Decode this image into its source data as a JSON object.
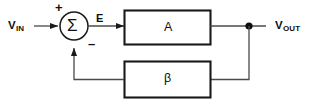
{
  "diagram": {
    "colors": {
      "line": "#4a4a4a",
      "block_border": "#1a1a1a",
      "text": "#101010",
      "background": "#ffffff"
    },
    "labels": {
      "input_prefix": "V",
      "input_subscript": "IN",
      "output_prefix": "V",
      "output_subscript": "OUT",
      "error_signal": "E",
      "summing_symbol": "Σ",
      "plus_sign": "+",
      "minus_sign": "–",
      "forward_block": "A",
      "feedback_block": "β"
    },
    "nodes": [
      {
        "name": "input-terminal",
        "label": "V_IN"
      },
      {
        "name": "summing-junction",
        "label": "Σ"
      },
      {
        "name": "forward-gain-block",
        "label": "A"
      },
      {
        "name": "output-node",
        "label": "junction-dot"
      },
      {
        "name": "feedback-block",
        "label": "β"
      },
      {
        "name": "output-terminal",
        "label": "V_OUT"
      }
    ]
  }
}
